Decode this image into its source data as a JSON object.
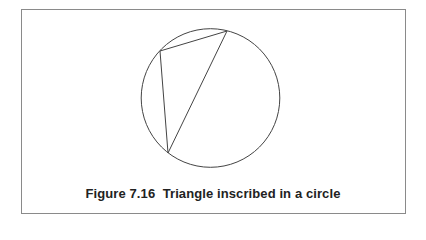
{
  "figure": {
    "caption": "Figure 7.16  Triangle inscribed in a circle",
    "frame_color": "#8a8a8a",
    "line_color": "#444444"
  },
  "diagram": {
    "circle": {
      "cx": 210.5,
      "cy": 98,
      "r": 69.3
    },
    "triangle": {
      "vertices": [
        {
          "name": "top-right",
          "x": 227,
          "y": 31
        },
        {
          "name": "top-left",
          "x": 160,
          "y": 51
        },
        {
          "name": "bottom",
          "x": 168,
          "y": 153
        }
      ]
    }
  }
}
